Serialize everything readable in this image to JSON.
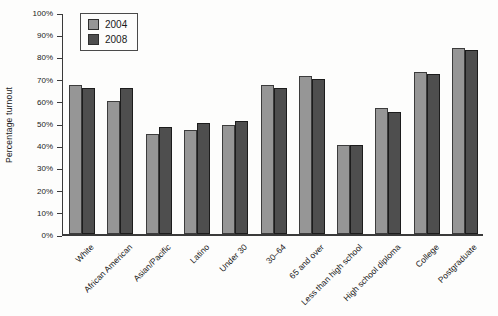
{
  "chart_data": {
    "type": "bar",
    "title": "",
    "xlabel": "",
    "ylabel": "Percentage turnout",
    "ylim": [
      0,
      100
    ],
    "yticks": [
      0,
      10,
      20,
      30,
      40,
      50,
      60,
      70,
      80,
      90,
      100
    ],
    "ytick_labels": [
      "0%",
      "10%",
      "20%",
      "30%",
      "40%",
      "50%",
      "60%",
      "70%",
      "80%",
      "90%",
      "100%"
    ],
    "grid": false,
    "legend_position": "top-left",
    "categories": [
      "White",
      "African American",
      "Asian/Pacific",
      "Latino",
      "Under 30",
      "30–64",
      "65 and over",
      "Less than high school",
      "High school diploma",
      "College",
      "Postgraduate"
    ],
    "series": [
      {
        "name": "2004",
        "color": "#969696",
        "border_color": "#3c3c3c",
        "values": [
          67,
          60,
          45,
          47,
          49,
          67,
          71,
          40,
          57,
          73,
          84
        ]
      },
      {
        "name": "2008",
        "color": "#4e4e4e",
        "border_color": "#1c1c1c",
        "values": [
          66,
          66,
          48,
          50,
          51,
          66,
          70,
          40,
          55,
          72,
          83
        ]
      }
    ]
  }
}
